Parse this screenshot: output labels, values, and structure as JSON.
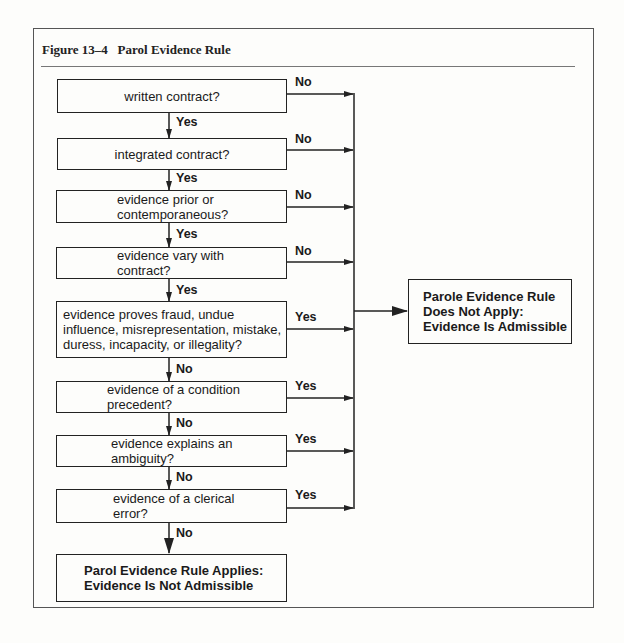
{
  "figure": {
    "title": "Figure 13–4   Parol Evidence Rule"
  },
  "questions": [
    {
      "text": "written contract?",
      "continue_label": "Yes",
      "exit_label": "No"
    },
    {
      "text": "integrated contract?",
      "continue_label": "Yes",
      "exit_label": "No"
    },
    {
      "line1": "evidence prior or",
      "line2": "contemporaneous?",
      "continue_label": "Yes",
      "exit_label": "No"
    },
    {
      "line1": "evidence vary with",
      "line2": "contract?",
      "continue_label": "Yes",
      "exit_label": "No"
    },
    {
      "line1": "evidence proves fraud, undue",
      "line2": "influence, misrepresentation, mistake,",
      "line3": "duress, incapacity, or illegality?",
      "continue_label": "No",
      "exit_label": "Yes"
    },
    {
      "line1": "evidence of a condition",
      "line2": "precedent?",
      "continue_label": "No",
      "exit_label": "Yes"
    },
    {
      "line1": "evidence explains an",
      "line2": "ambiguity?",
      "continue_label": "No",
      "exit_label": "Yes"
    },
    {
      "line1": "evidence of a clerical",
      "line2": "error?",
      "continue_label": "No",
      "exit_label": "Yes"
    }
  ],
  "outcomes": {
    "admissible": {
      "line1": "Parole Evidence Rule",
      "line2": "Does Not Apply:",
      "line3": "Evidence Is Admissible"
    },
    "not_admissible": {
      "line1": "Parol Evidence Rule Applies:",
      "line2": "Evidence Is Not Admissible"
    }
  }
}
